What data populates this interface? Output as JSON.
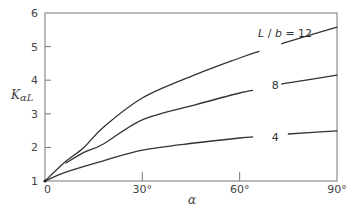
{
  "chart_data": {
    "type": "line",
    "title": "",
    "xlabel": "α",
    "ylabel": "KαL",
    "xlim": [
      0,
      90
    ],
    "ylim": [
      1,
      6
    ],
    "grid": false,
    "legend_position": "inline",
    "x_ticks": [
      {
        "value": 0,
        "label": "0"
      },
      {
        "value": 30,
        "label": "30°"
      },
      {
        "value": 60,
        "label": "60°"
      },
      {
        "value": 90,
        "label": "90°"
      }
    ],
    "y_ticks": [
      {
        "value": 1,
        "label": "1"
      },
      {
        "value": 2,
        "label": "2"
      },
      {
        "value": 3,
        "label": "3"
      },
      {
        "value": 4,
        "label": "4"
      },
      {
        "value": 5,
        "label": "5"
      },
      {
        "value": 6,
        "label": "6"
      }
    ],
    "series": [
      {
        "name": "L/b = 12",
        "label": "L/b = 12",
        "label_at": {
          "x": 74,
          "y": 5.4
        },
        "gap": [
          66,
          73
        ],
        "points": [
          [
            0,
            1.0
          ],
          [
            6,
            1.55
          ],
          [
            12,
            2.0
          ],
          [
            18,
            2.6
          ],
          [
            30,
            3.47
          ],
          [
            46,
            4.15
          ],
          [
            60,
            4.66
          ],
          [
            75,
            5.15
          ],
          [
            90,
            5.58
          ]
        ]
      },
      {
        "name": "L/b = 8",
        "label": "8",
        "label_at": {
          "x": 71,
          "y": 3.85
        },
        "gap": [
          64,
          73
        ],
        "points": [
          [
            6.5,
            1.54
          ],
          [
            12,
            1.85
          ],
          [
            18,
            2.1
          ],
          [
            30,
            2.82
          ],
          [
            46,
            3.26
          ],
          [
            60,
            3.62
          ],
          [
            75,
            3.92
          ],
          [
            90,
            4.15
          ]
        ]
      },
      {
        "name": "L/b = 4",
        "label": "4",
        "label_at": {
          "x": 71,
          "y": 2.3
        },
        "gap": [
          64,
          75
        ],
        "points": [
          [
            0,
            1.0
          ],
          [
            6,
            1.25
          ],
          [
            18,
            1.6
          ],
          [
            30,
            1.92
          ],
          [
            46,
            2.13
          ],
          [
            60,
            2.28
          ],
          [
            75,
            2.4
          ],
          [
            90,
            2.49
          ]
        ]
      }
    ]
  }
}
